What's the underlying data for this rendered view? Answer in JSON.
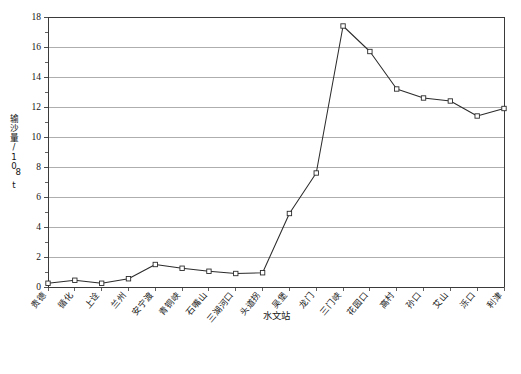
{
  "chart_data": {
    "type": "line",
    "title": "",
    "xlabel": "水文站",
    "ylabel": "输沙量/10⁸t",
    "ylim": [
      0,
      18
    ],
    "ytick_step": 2,
    "minor_tick_step": 1,
    "grid": "horizontal",
    "legend": "none",
    "marker": "open-square",
    "line_color": "#2b2b2b",
    "grid_color": "#9a9a9a",
    "axis_color": "#3a3a3a",
    "marker_fill": "#ffffff",
    "categories": [
      "贵德",
      "循化",
      "上诠",
      "兰州",
      "安宁渡",
      "青铜峡",
      "石嘴山",
      "三湖河口",
      "头道拐",
      "吴堡",
      "龙门",
      "三门峡",
      "花园口",
      "高村",
      "孙口",
      "艾山",
      "泺口",
      "利津"
    ],
    "values": [
      0.25,
      0.45,
      0.25,
      0.55,
      1.5,
      1.25,
      1.05,
      0.9,
      0.95,
      4.9,
      7.6,
      17.4,
      15.7,
      13.2,
      12.6,
      12.4,
      11.4,
      11.9
    ],
    "ytick_labels": [
      "0",
      "2",
      "4",
      "6",
      "8",
      "10",
      "12",
      "14",
      "16",
      "18"
    ],
    "ytick_values": [
      0,
      2,
      4,
      6,
      8,
      10,
      12,
      14,
      16,
      18
    ]
  },
  "yaxis": {
    "label_chars": [
      "输",
      "沙",
      "量",
      "/",
      "1",
      "0",
      "8",
      "t"
    ],
    "label_text": "输沙量/10⁸t"
  },
  "xaxis": {
    "title": "水文站"
  }
}
